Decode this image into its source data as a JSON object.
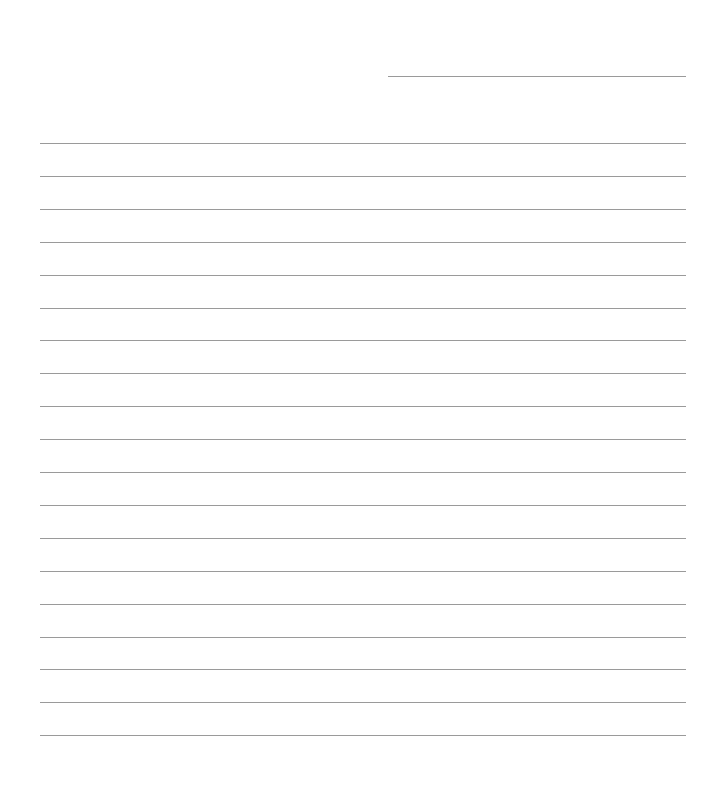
{
  "page": {
    "type": "lined-paper",
    "line_color": "#9a9a9a",
    "background": "#ffffff",
    "header_line": {
      "x": 388,
      "y": 76,
      "width": 298
    },
    "rules": {
      "count": 19,
      "x": 40,
      "width": 646,
      "first_y": 143,
      "spacing": 32.9
    }
  }
}
